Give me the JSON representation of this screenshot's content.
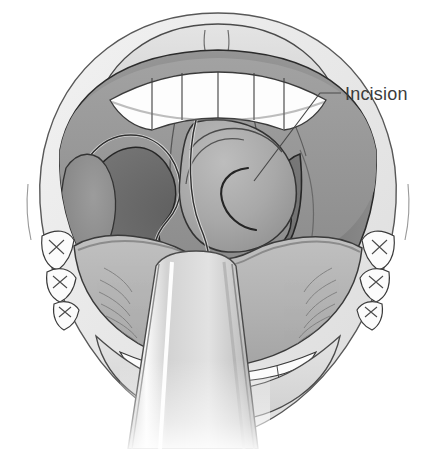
{
  "figure": {
    "background_color": "#ffffff"
  },
  "annotations": [
    {
      "id": "incision",
      "label": "Incision",
      "text_color": "#3c3c3c",
      "font_size_px": 18,
      "text_x": 345,
      "text_y": 100,
      "leader": {
        "color": "#4a4a4a",
        "width_px": 1.2,
        "points": [
          {
            "x": 254,
            "y": 181
          },
          {
            "x": 320,
            "y": 93
          },
          {
            "x": 341,
            "y": 93
          }
        ]
      }
    }
  ],
  "anatomy": {
    "parts": [
      {
        "id": "face",
        "label": "Face and lips",
        "fill": "#e8e8e8",
        "stroke": "#555555"
      },
      {
        "id": "upper-lip",
        "label": "Upper lip",
        "fill": "#d8d8d8",
        "stroke": "#444444"
      },
      {
        "id": "philtrum",
        "label": "Philtrum",
        "stroke": "#6a6a6a"
      },
      {
        "id": "upper-teeth",
        "label": "Upper teeth",
        "fill": "#fdfdfd",
        "stroke": "#3a3a3a"
      },
      {
        "id": "lower-teeth",
        "label": "Lower teeth",
        "fill": "#fdfdfd",
        "stroke": "#3a3a3a"
      },
      {
        "id": "molars-left",
        "label": "Left molars",
        "fill": "#fbfbfb",
        "stroke": "#3a3a3a"
      },
      {
        "id": "molars-right",
        "label": "Right molars",
        "fill": "#fbfbfb",
        "stroke": "#3a3a3a"
      },
      {
        "id": "oral-cavity",
        "label": "Oral cavity",
        "fill": "#8f8f8f",
        "stroke": "#2b2b2b"
      },
      {
        "id": "hard-palate",
        "label": "Hard palate",
        "fill": "#9a9a9a",
        "stroke": "#3a3a3a"
      },
      {
        "id": "soft-palate",
        "label": "Soft palate",
        "fill": "#969696",
        "stroke": "#3a3a3a"
      },
      {
        "id": "uvula",
        "label": "Uvula",
        "fill": "#a0a0a0",
        "stroke": "#2e2e2e"
      },
      {
        "id": "pharynx",
        "label": "Posterior pharyngeal wall",
        "fill": "#6d6d6d",
        "stroke": "#2b2b2b"
      },
      {
        "id": "tonsil-left",
        "label": "Left palatine tonsil",
        "fill": "#8a8a8a",
        "stroke": "#333333"
      },
      {
        "id": "tonsil-right",
        "label": "Right palatine tonsil",
        "fill": "#a6a6a6",
        "stroke": "#333333"
      },
      {
        "id": "incision-arc",
        "label": "Incision arc on right tonsil",
        "stroke": "#2a2a2a"
      },
      {
        "id": "tongue",
        "label": "Tongue",
        "fill": "#b4b4b4",
        "stroke": "#3a3a3a"
      },
      {
        "id": "tongue-depressor",
        "label": "Tongue depressor",
        "fill": "#d5d5d5",
        "stroke": "#4a4a4a"
      }
    ]
  }
}
